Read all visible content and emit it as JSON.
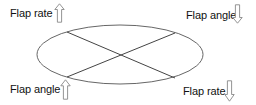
{
  "diagram": {
    "labels": {
      "top_left": {
        "text": "Flap rate",
        "arrow": "up"
      },
      "top_right": {
        "text": "Flap angle",
        "arrow": "down"
      },
      "bottom_left": {
        "text": "Flap angle",
        "arrow": "up"
      },
      "bottom_right": {
        "text": "Flap rate",
        "arrow": "down"
      }
    },
    "colors": {
      "line": "#555555",
      "text": "#111111",
      "arrow_stroke": "#888888",
      "background": "#ffffff"
    }
  }
}
